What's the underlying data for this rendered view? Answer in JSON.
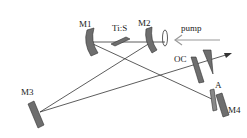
{
  "diagram": {
    "type": "laser-cavity-schematic",
    "labels": {
      "m1": "M1",
      "m2": "M2",
      "m3": "M3",
      "m4": "M4",
      "crystal": "Ti:S",
      "pump": "pump",
      "output_coupler": "OC",
      "aperture": "A"
    },
    "colors": {
      "mirror_fill": "#6e6e6e",
      "beam": "#333333",
      "pump_arrow": "#9a9a9a",
      "label": "#222222"
    }
  }
}
